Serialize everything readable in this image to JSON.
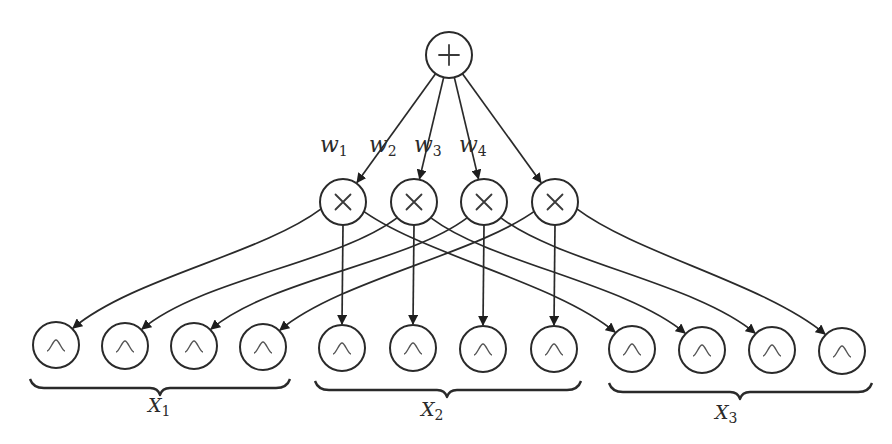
{
  "diagram": {
    "type": "sum-product network",
    "sum_node": {
      "symbol": "+",
      "label": "sum-node",
      "cx": 449,
      "cy": 55
    },
    "product_nodes": [
      {
        "symbol": "×",
        "cx": 343,
        "cy": 202,
        "weight": "w",
        "weight_sub": "1",
        "weight_pos": [
          348,
          152
        ]
      },
      {
        "symbol": "×",
        "cx": 414,
        "cy": 202,
        "weight": "w",
        "weight_sub": "2",
        "weight_pos": [
          397,
          152
        ]
      },
      {
        "symbol": "×",
        "cx": 484,
        "cy": 202,
        "weight": "w",
        "weight_sub": "3",
        "weight_pos": [
          442,
          152
        ]
      },
      {
        "symbol": "×",
        "cx": 555,
        "cy": 202,
        "weight": "w",
        "weight_sub": "4",
        "weight_pos": [
          487,
          152
        ]
      }
    ],
    "leaf_groups": [
      {
        "variable": "X",
        "variable_sub": "1",
        "leaf_symbol": "gaussian",
        "leaves": [
          {
            "cx": 56,
            "cy": 345
          },
          {
            "cx": 125,
            "cy": 346
          },
          {
            "cx": 194,
            "cy": 346
          },
          {
            "cx": 263,
            "cy": 347
          }
        ],
        "brace": {
          "x1": 30,
          "x2": 290,
          "y": 384,
          "tip": 160
        },
        "label_pos": [
          148,
          412
        ]
      },
      {
        "variable": "X",
        "variable_sub": "2",
        "leaf_symbol": "gaussian",
        "leaves": [
          {
            "cx": 342,
            "cy": 348
          },
          {
            "cx": 413,
            "cy": 348
          },
          {
            "cx": 483,
            "cy": 349
          },
          {
            "cx": 554,
            "cy": 349
          }
        ],
        "brace": {
          "x1": 315,
          "x2": 581,
          "y": 386,
          "tip": 447
        },
        "label_pos": [
          421,
          416
        ]
      },
      {
        "variable": "X",
        "variable_sub": "3",
        "leaf_symbol": "gaussian",
        "leaves": [
          {
            "cx": 632,
            "cy": 349
          },
          {
            "cx": 702,
            "cy": 350
          },
          {
            "cx": 772,
            "cy": 350
          },
          {
            "cx": 842,
            "cy": 351
          }
        ],
        "brace": {
          "x1": 609,
          "x2": 872,
          "y": 388,
          "tip": 740
        },
        "label_pos": [
          715,
          419
        ]
      }
    ],
    "node_radius": 23,
    "edges_description": "Sum node connects to each product node i with weight w_i; product node i connects to leaf i of X1, leaf i of X2, and leaf i of X3."
  }
}
